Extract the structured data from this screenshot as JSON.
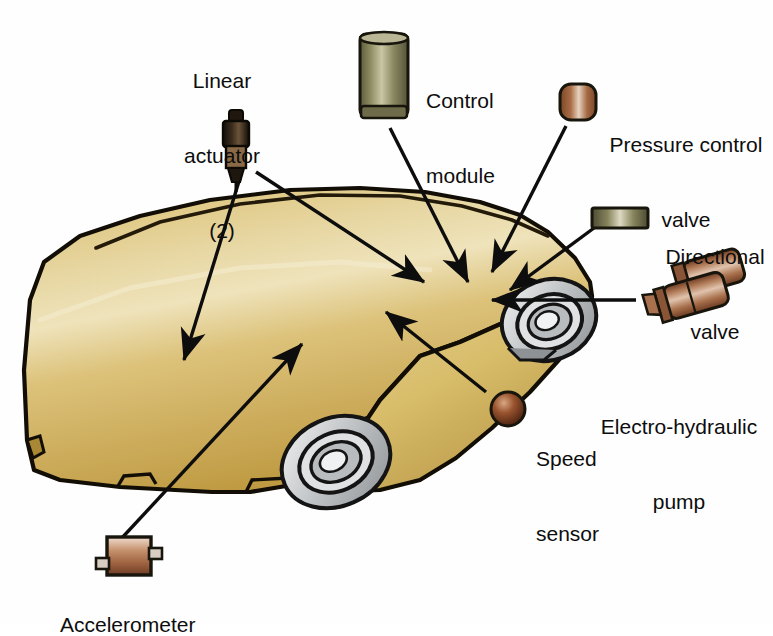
{
  "diagram": {
    "background_color": "#ffffff",
    "body_color_light": "#e6d49a",
    "body_color_mid": "#d4b964",
    "body_color_dark": "#b8963f",
    "outline_color": "#1a1408",
    "wheel_color": "#c9cbcc",
    "copper_color": "#a9apa",
    "text_color": "#0d0d0d"
  },
  "labels": {
    "linear_actuator": {
      "line1": "Linear",
      "line2": "actuator",
      "line3": "(2)"
    },
    "control_module": {
      "line1": "Control",
      "line2": "module"
    },
    "pressure_control_valve": {
      "line1": "Pressure control",
      "line2": "valve"
    },
    "directional_valve": {
      "line1": "Directional",
      "line2": "valve"
    },
    "electro_hydraulic_pump": {
      "line1": "Electro-hydraulic",
      "line2": "pump"
    },
    "speed_sensor": {
      "line1": "Speed",
      "line2": "sensor"
    },
    "accelerometer": {
      "line1": "Accelerometer"
    }
  },
  "components": [
    {
      "name": "linear-actuator-icon",
      "kind": "spark-plug-cylinder",
      "color": "#2e2418"
    },
    {
      "name": "control-module-icon",
      "kind": "cylinder",
      "color": "#8c8a5e"
    },
    {
      "name": "pressure-control-valve-icon",
      "kind": "rounded-square",
      "color": "#9a5f3f"
    },
    {
      "name": "directional-valve-icon",
      "kind": "flat-bar",
      "color": "#7c7a56"
    },
    {
      "name": "electro-hydraulic-pump-icon",
      "kind": "multi-cylinder",
      "color": "#a06a4c"
    },
    {
      "name": "speed-sensor-icon",
      "kind": "sphere",
      "color": "#8b4a28"
    },
    {
      "name": "accelerometer-icon",
      "kind": "box-with-tabs",
      "color": "#b07a57"
    }
  ]
}
